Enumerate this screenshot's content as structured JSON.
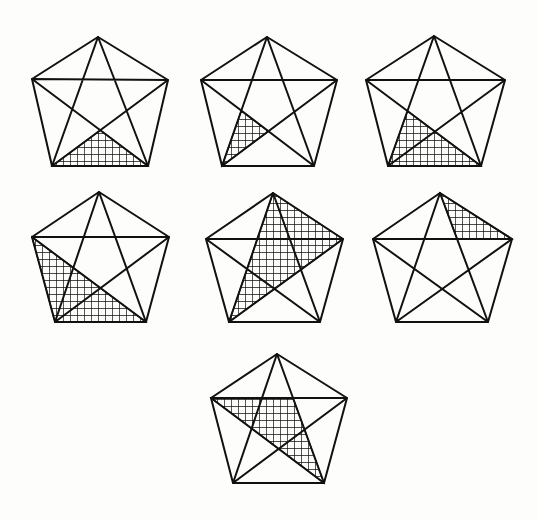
{
  "figure": {
    "colors": {
      "line": "#111111",
      "background": "#fdfdfb",
      "hatch": "#111111"
    },
    "hatch_spacing": 7,
    "pentagons": [
      {
        "id": 1,
        "T": [
          98,
          37
        ],
        "L": [
          32,
          79
        ],
        "R": [
          168,
          80
        ],
        "BL": [
          52,
          166
        ],
        "BR": [
          148,
          166
        ],
        "shaded_region": "bottom-triangle"
      },
      {
        "id": 2,
        "T": [
          267,
          37
        ],
        "L": [
          201,
          80
        ],
        "R": [
          337,
          80
        ],
        "BL": [
          222,
          166
        ],
        "BR": [
          314,
          166
        ],
        "shaded_region": "small-left-triangle"
      },
      {
        "id": 3,
        "T": [
          434,
          36
        ],
        "L": [
          366,
          80
        ],
        "R": [
          505,
          80
        ],
        "BL": [
          388,
          166
        ],
        "BR": [
          481,
          166
        ],
        "shaded_region": "large-bottom-triangle"
      },
      {
        "id": 4,
        "T": [
          99,
          192
        ],
        "L": [
          32,
          237
        ],
        "R": [
          169,
          237
        ],
        "BL": [
          55,
          322
        ],
        "BR": [
          146,
          322
        ],
        "shaded_region": "left-bottom-triangle"
      },
      {
        "id": 5,
        "T": [
          273,
          193
        ],
        "L": [
          206,
          239
        ],
        "R": [
          343,
          239
        ],
        "BL": [
          229,
          322
        ],
        "BR": [
          320,
          322
        ],
        "shaded_region": "top-right-bottom-left-triangle"
      },
      {
        "id": 6,
        "T": [
          440,
          193
        ],
        "L": [
          373,
          239
        ],
        "R": [
          512,
          239
        ],
        "BL": [
          396,
          322
        ],
        "BR": [
          488,
          322
        ],
        "shaded_region": "small-top-right-triangle"
      },
      {
        "id": 7,
        "T": [
          277,
          354
        ],
        "L": [
          211,
          398
        ],
        "R": [
          347,
          398
        ],
        "BL": [
          233,
          483
        ],
        "BR": [
          324,
          483
        ],
        "shaded_region": "left-to-bottom-right-triangle"
      }
    ]
  }
}
